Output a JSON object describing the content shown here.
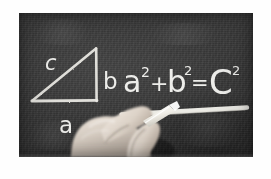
{
  "scene": {
    "kind": "photograph",
    "subject": "blackboard-pythagorean-theorem",
    "caption_alt": "Hand writing the Pythagorean theorem on a blackboard with chalk"
  },
  "colors": {
    "page_background": "#ffffff",
    "board_background": "#3a3a3a",
    "chalk": "#ededea",
    "hand_skin": "#d8cfc6",
    "chalk_stick": "#f2f0ea"
  },
  "board": {
    "frame": {
      "x": 19,
      "y": 13,
      "width": 234,
      "height": 144
    }
  },
  "diagram": {
    "name": "right-triangle",
    "vertices": {
      "apex": [
        77,
        35
      ],
      "bottom_right": [
        77,
        87
      ],
      "bottom_left": [
        13,
        87
      ]
    },
    "labels": [
      {
        "id": "label-c",
        "text": "c",
        "side": "hypotenuse",
        "x": 30,
        "y": 50
      },
      {
        "id": "label-b",
        "text": "b",
        "side": "vertical-leg",
        "x": 88,
        "y": 68
      },
      {
        "id": "label-a",
        "text": "a",
        "side": "horizontal-leg",
        "x": 45,
        "y": 112
      }
    ]
  },
  "equation": {
    "full_text": "a² + b² = c²",
    "terms": [
      {
        "id": "term-a",
        "base": "a",
        "exponent": "2"
      },
      {
        "id": "operator-plus",
        "symbol": "+"
      },
      {
        "id": "term-b",
        "base": "b",
        "exponent": "2"
      },
      {
        "id": "operator-equals",
        "symbol": "="
      },
      {
        "id": "term-c",
        "base": "C",
        "exponent": "2"
      }
    ],
    "underline": {
      "present": true,
      "style": "thick-chalk-stroke"
    }
  },
  "hand": {
    "present": true,
    "description": "hand-holding-chalk",
    "chalk": {
      "present": true,
      "angle_deg": 45
    }
  }
}
